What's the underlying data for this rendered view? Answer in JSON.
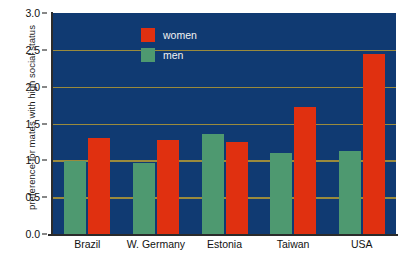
{
  "chart_data": {
    "type": "bar",
    "title": "",
    "xlabel": "",
    "ylabel": "preference for  mates with high social status",
    "categories": [
      "Brazil",
      "W. Germany",
      "Estonia",
      "Taiwan",
      "USA"
    ],
    "series": [
      {
        "name": "women",
        "color": "#e03010",
        "values": [
          1.31,
          1.28,
          1.25,
          1.73,
          2.45
        ]
      },
      {
        "name": "men",
        "color": "#4e9970",
        "values": [
          0.99,
          0.96,
          1.36,
          1.1,
          1.13
        ]
      }
    ],
    "ylim": [
      0.0,
      3.0
    ],
    "yticks": [
      "0.0",
      "0.5",
      "1.0",
      "1.5",
      "2.0",
      "2.5",
      "3.0"
    ],
    "ytick_values": [
      0.0,
      0.5,
      1.0,
      1.5,
      2.0,
      2.5,
      3.0
    ],
    "grid": true,
    "grid_color": "#9a8a3c",
    "plot_background": "#103a72",
    "figure_background": "#ffffff",
    "legend_position": "top-left-inside",
    "legend": [
      {
        "label": "women",
        "color": "#e03010"
      },
      {
        "label": "men",
        "color": "#4e9970"
      }
    ]
  }
}
